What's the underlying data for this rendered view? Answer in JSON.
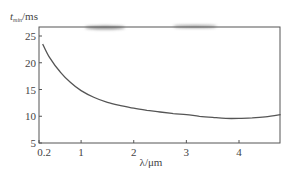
{
  "chart_data": {
    "type": "line",
    "title": "",
    "xlabel": "λ/μm",
    "ylabel": "t_min/ms",
    "ylabel_main": "t",
    "ylabel_sub": "min",
    "ylabel_unit": "/ms",
    "xlim": [
      0.2,
      4.79
    ],
    "ylim": [
      5,
      26
    ],
    "xticks": [
      0.2,
      1,
      2,
      3,
      4
    ],
    "xtick_labels": [
      "0.2",
      "1",
      "2",
      "3",
      "4"
    ],
    "yticks": [
      5,
      10,
      15,
      20,
      25
    ],
    "ytick_labels": [
      "5",
      "10",
      "15",
      "20",
      "25"
    ],
    "grid": false,
    "legend": null,
    "series": [
      {
        "name": "t_min",
        "x": [
          0.27,
          0.4,
          0.6,
          0.8,
          1.0,
          1.25,
          1.5,
          1.75,
          2.0,
          2.25,
          2.5,
          2.75,
          3.0,
          3.25,
          3.5,
          3.75,
          4.0,
          4.25,
          4.5,
          4.79
        ],
        "y": [
          23.5,
          21.0,
          18.3,
          16.3,
          14.8,
          13.5,
          12.6,
          12.0,
          11.5,
          11.1,
          10.8,
          10.5,
          10.3,
          10.0,
          9.8,
          9.6,
          9.6,
          9.7,
          9.9,
          10.3
        ]
      }
    ]
  },
  "colors": {
    "line": "#555555",
    "axis": "#555555",
    "artifact": "#9a9a9a"
  }
}
